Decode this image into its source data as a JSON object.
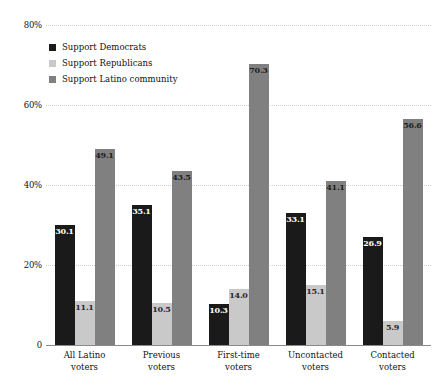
{
  "chart_data": {
    "type": "bar",
    "title": "",
    "subtitle": "",
    "xlabel": "",
    "ylabel": "",
    "ylim": [
      0,
      80
    ],
    "grid": true,
    "legend_position": "top-left",
    "categories": [
      "All Latino voters",
      "Previous voters",
      "First-time voters",
      "Uncontacted voters",
      "Contacted voters"
    ],
    "category_lines": [
      [
        "All Latino",
        "voters"
      ],
      [
        "Previous",
        "voters"
      ],
      [
        "First-time",
        "voters"
      ],
      [
        "Uncontacted",
        "voters"
      ],
      [
        "Contacted",
        "voters"
      ]
    ],
    "series": [
      {
        "name": "Support Democrats",
        "color": "#1a1a1a",
        "values": [
          30.1,
          35.1,
          10.3,
          33.1,
          26.9
        ],
        "labels": [
          "30.1",
          "35.1",
          "10.3",
          "33.1",
          "26.9"
        ]
      },
      {
        "name": "Support Republicans",
        "color": "#c9c9c9",
        "values": [
          11.1,
          10.5,
          14.0,
          15.1,
          5.9
        ],
        "labels": [
          "11.1",
          "10.5",
          "14.0",
          "15.1",
          "5.9"
        ]
      },
      {
        "name": "Support Latino community",
        "color": "#808080",
        "values": [
          49.1,
          43.5,
          70.3,
          41.1,
          56.6
        ],
        "labels": [
          "49.1",
          "43.5",
          "70.3",
          "41.1",
          "56.6"
        ]
      }
    ],
    "y_ticks": [
      0,
      20,
      40,
      60,
      80
    ],
    "y_tick_labels": [
      "0",
      "20%",
      "40%",
      "60%",
      "80%"
    ]
  }
}
